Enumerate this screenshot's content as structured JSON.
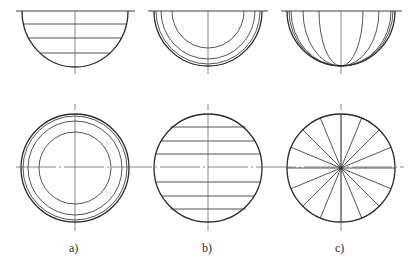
{
  "figure": {
    "panels": [
      {
        "id": "a",
        "label": "a)",
        "description": "Hemisphere with latitude lines (top) and concentric circles (plan view)",
        "center_x": 75,
        "top_view": {
          "type": "horizontal-chords",
          "chord_ys": [
            24,
            38,
            53
          ]
        },
        "bottom_view": {
          "type": "concentric-circles",
          "radii": [
            54,
            52,
            47,
            36
          ]
        }
      },
      {
        "id": "b",
        "label": "b)",
        "description": "Hemisphere with concentric arcs (top) and parallel horizontal chords (plan view)",
        "center_x": 208,
        "top_view": {
          "type": "concentric-arcs",
          "radii": [
            54,
            52,
            47,
            36
          ]
        },
        "bottom_view": {
          "type": "horizontal-chords",
          "offsets": [
            -41,
            -27,
            -14,
            0,
            14,
            27,
            41
          ]
        }
      },
      {
        "id": "c",
        "label": "c)",
        "description": "Hemisphere with meridian lines (top) and radial spokes (plan view)",
        "center_x": 341,
        "top_view": {
          "type": "meridians",
          "x_radii": [
            54,
            50,
            38,
            22,
            0
          ]
        },
        "bottom_view": {
          "type": "radial-spokes",
          "count": 16
        }
      }
    ],
    "colors": {
      "line": "#2a2a2a",
      "centerline": "#555555",
      "background": "#ffffff"
    }
  }
}
